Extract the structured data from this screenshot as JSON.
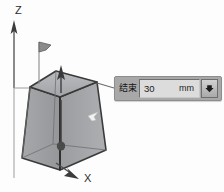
{
  "viewport": {
    "background_color": "#fdfdfd",
    "axes": [
      {
        "name": "z-axis",
        "label": "Z"
      },
      {
        "name": "x-axis",
        "label": "X"
      }
    ],
    "model": {
      "name": "tapered-box-solid",
      "face_color": "#8f9194",
      "edge_color": "#3a3a3a",
      "handles": [
        {
          "name": "flag-handle",
          "label": ""
        },
        {
          "name": "extrude-arrow-handle",
          "label": ""
        },
        {
          "name": "direction-arrow-handle",
          "label": ""
        },
        {
          "name": "face-cursor-glyph",
          "label": ""
        }
      ]
    }
  },
  "callout": {
    "name": "parameter-callout",
    "label": "结束",
    "value": "30",
    "unit": "mm",
    "spinner_icon": "chevron-down-icon",
    "panel_color": "#a8a8a8",
    "field_color": "#dcdcdc"
  }
}
